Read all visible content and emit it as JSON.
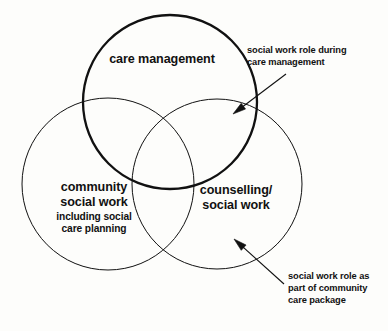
{
  "diagram": {
    "type": "venn",
    "background_color": "#fdfdfb",
    "stroke_color": "#111111",
    "circles": [
      {
        "id": "care-management",
        "label": "care management",
        "emphasis": "bold-stroke",
        "cx": 170,
        "cy": 102,
        "r": 87,
        "stroke_width": 2.3
      },
      {
        "id": "community-social-work",
        "label": "community\nsocial work",
        "sublabel": "including social\ncare planning",
        "emphasis": "thin-stroke",
        "cx": 108,
        "cy": 184,
        "r": 86,
        "stroke_width": 1
      },
      {
        "id": "counselling-social-work",
        "label": "counselling/\nsocial work",
        "emphasis": "thin-stroke",
        "cx": 217,
        "cy": 184,
        "r": 85,
        "stroke_width": 1
      }
    ],
    "annotations": [
      {
        "id": "note-care-management",
        "text": "social work role during\ncare management",
        "arrow": {
          "tail_x": 286,
          "tail_y": 74,
          "tip_x": 233,
          "tip_y": 114
        }
      },
      {
        "id": "note-community-package",
        "text": "social work role as\npart of community\ncare package",
        "arrow": {
          "tail_x": 284,
          "tail_y": 284,
          "tip_x": 234,
          "tip_y": 239
        }
      }
    ]
  }
}
